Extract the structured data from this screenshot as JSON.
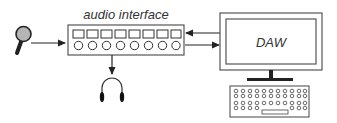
{
  "diagram": {
    "nodes": {
      "microphone": {
        "label": "",
        "icon": "microphone-icon"
      },
      "audio_interface": {
        "label": "audio interface",
        "inputs_squares": 8,
        "knobs_circles": 8
      },
      "headphones": {
        "label": "",
        "icon": "headphones-icon"
      },
      "computer": {
        "label": "DAW",
        "icon": "monitor-icon"
      },
      "keyboard": {
        "label": "",
        "icon": "keyboard-icon",
        "rows": 4,
        "cols": 10
      }
    },
    "edges": [
      {
        "from": "microphone",
        "to": "audio_interface"
      },
      {
        "from": "audio_interface",
        "to": "headphones"
      },
      {
        "from": "computer",
        "to": "audio_interface"
      },
      {
        "from": "audio_interface",
        "to": "computer"
      }
    ],
    "colors": {
      "stroke": "#333333",
      "mic_head": "#b5b5b5",
      "background": "#ffffff"
    }
  }
}
